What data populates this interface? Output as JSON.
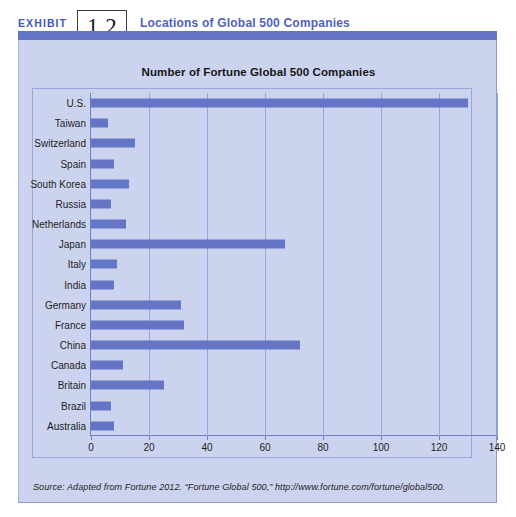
{
  "exhibit": {
    "label": "EXHIBIT",
    "number": "1.2",
    "title": "Locations of Global 500 Companies"
  },
  "colors": {
    "bar": "#6475c6",
    "panel_bg": "#ccd3ef",
    "grid": "#9aa5dd",
    "axis": "#6f7ecb",
    "title_blue": "#5160bf",
    "rule": "#6475c6"
  },
  "source": {
    "prefix": "Source: Adapted from",
    "text": "Source: Adapted from Fortune 2012. “Fortune Global 500,” http://www.fortune.com/fortune/global500."
  },
  "chart_data": {
    "type": "bar",
    "orientation": "horizontal",
    "title": "Number of Fortune Global 500 Companies",
    "xlabel": "",
    "ylabel": "",
    "xlim": [
      0,
      140
    ],
    "xticks": [
      0,
      20,
      40,
      60,
      80,
      100,
      120,
      140
    ],
    "grid": true,
    "legend": "none",
    "categories": [
      "U.S.",
      "Taiwan",
      "Switzerland",
      "Spain",
      "South Korea",
      "Russia",
      "Netherlands",
      "Japan",
      "Italy",
      "India",
      "Germany",
      "France",
      "China",
      "Canada",
      "Britain",
      "Brazil",
      "Australia"
    ],
    "values": [
      130,
      6,
      15,
      8,
      13,
      7,
      12,
      67,
      9,
      8,
      31,
      32,
      72,
      11,
      25,
      7,
      8
    ]
  }
}
